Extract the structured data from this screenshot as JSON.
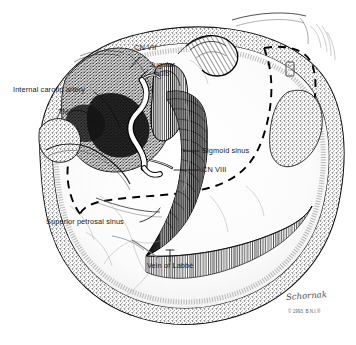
{
  "figure": {
    "kind": "anatomical-line-illustration",
    "background_color": "#ffffff",
    "ink_color": "#000000",
    "label_color": "#1a1a1a",
    "dashed_outline_label": "craniotomy outline"
  },
  "labels": [
    {
      "id": "cn7",
      "text": "CN VII",
      "x": 134,
      "y": 48,
      "lines": 1
    },
    {
      "id": "jugular_bulb",
      "text": "Jugular",
      "x": 150,
      "y": 65,
      "lines": 1
    },
    {
      "id": "jugular_bulb_2",
      "text": "bulb",
      "x": 155,
      "y": 74,
      "lines": 1
    },
    {
      "id": "internal_carotid",
      "text": "Internal carotid artery",
      "x": 13,
      "y": 90,
      "lines": 1
    },
    {
      "id": "tmj",
      "text": "TMJ",
      "x": 58,
      "y": 112,
      "lines": 1
    },
    {
      "id": "sigmoid_sinus",
      "text": "Sigmoid sinus",
      "x": 202,
      "y": 148,
      "lines": 1
    },
    {
      "id": "cn8",
      "text": "CN VIII",
      "x": 202,
      "y": 167,
      "lines": 1
    },
    {
      "id": "superior_petrosal",
      "text": "Superior petrosal sinus",
      "x": 46,
      "y": 222,
      "lines": 1
    },
    {
      "id": "vein_of_labbe",
      "text": "Vein of Labbé",
      "x": 147,
      "y": 265,
      "lines": 1
    }
  ],
  "credit": {
    "signature": "Schornak",
    "copyright": "© 1993, B.N.I.®"
  }
}
